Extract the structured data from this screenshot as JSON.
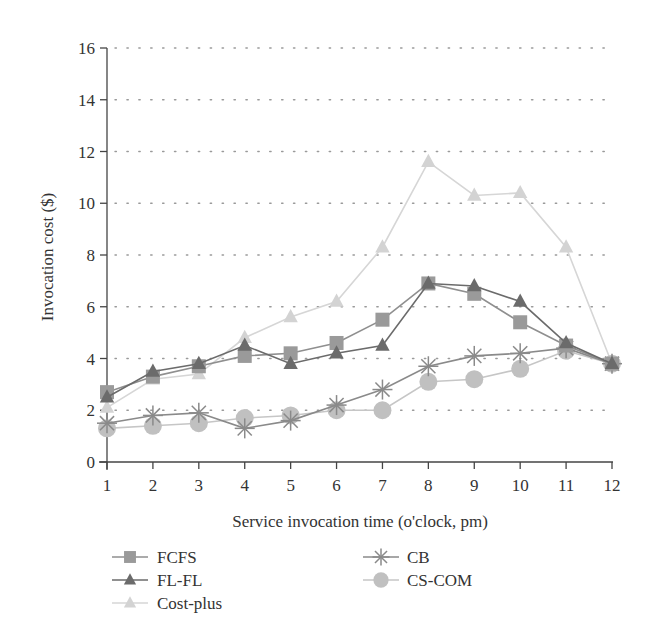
{
  "chart_data": {
    "type": "line",
    "title": "",
    "xlabel": "Service invocation time (o'clock, pm)",
    "ylabel": "Invocation cost ($)",
    "x": [
      1,
      2,
      3,
      4,
      5,
      6,
      7,
      8,
      9,
      10,
      11,
      12
    ],
    "xticks": [
      "1",
      "2",
      "3",
      "4",
      "5",
      "6",
      "7",
      "8",
      "9",
      "10",
      "11",
      "12"
    ],
    "yticks": [
      "0",
      "2",
      "4",
      "6",
      "8",
      "10",
      "12",
      "14",
      "16"
    ],
    "xlim": [
      1,
      12
    ],
    "ylim": [
      0,
      16
    ],
    "grid": "horizontal-dotted",
    "legend_position": "bottom",
    "series": [
      {
        "name": "FCFS",
        "marker": "square",
        "color": "#9a9a9a",
        "line": "#8f8f8f",
        "values": [
          2.7,
          3.3,
          3.7,
          4.1,
          4.2,
          4.6,
          5.5,
          6.9,
          6.5,
          5.4,
          4.5,
          3.8
        ]
      },
      {
        "name": "FL-FL",
        "marker": "triangle",
        "color": "#6b6b6b",
        "line": "#6b6b6b",
        "values": [
          2.5,
          3.5,
          3.8,
          4.5,
          3.8,
          4.2,
          4.5,
          6.9,
          6.8,
          6.2,
          4.6,
          3.8
        ]
      },
      {
        "name": "Cost-plus",
        "marker": "triangle",
        "color": "#d3d3d3",
        "line": "#d6d6d6",
        "values": [
          2.1,
          3.2,
          3.4,
          4.8,
          5.6,
          6.2,
          8.3,
          11.6,
          10.3,
          10.4,
          8.3,
          3.8
        ]
      },
      {
        "name": "CB",
        "marker": "star",
        "color": "#8a8a8a",
        "line": "#8a8a8a",
        "values": [
          1.5,
          1.8,
          1.9,
          1.3,
          1.6,
          2.2,
          2.8,
          3.7,
          4.1,
          4.2,
          4.4,
          3.8
        ]
      },
      {
        "name": "CS-COM",
        "marker": "circle",
        "color": "#c0c0c0",
        "line": "#c6c6c6",
        "values": [
          1.3,
          1.4,
          1.5,
          1.7,
          1.8,
          2.0,
          2.0,
          3.1,
          3.2,
          3.6,
          4.3,
          3.8
        ]
      }
    ]
  },
  "legend": {
    "items": [
      {
        "label": "FCFS"
      },
      {
        "label": "FL-FL"
      },
      {
        "label": "Cost-plus"
      },
      {
        "label": "CB"
      },
      {
        "label": "CS-COM"
      }
    ]
  },
  "axes": {
    "xlabel": "Service invocation time (o'clock, pm)",
    "ylabel": "Invocation cost ($)"
  }
}
